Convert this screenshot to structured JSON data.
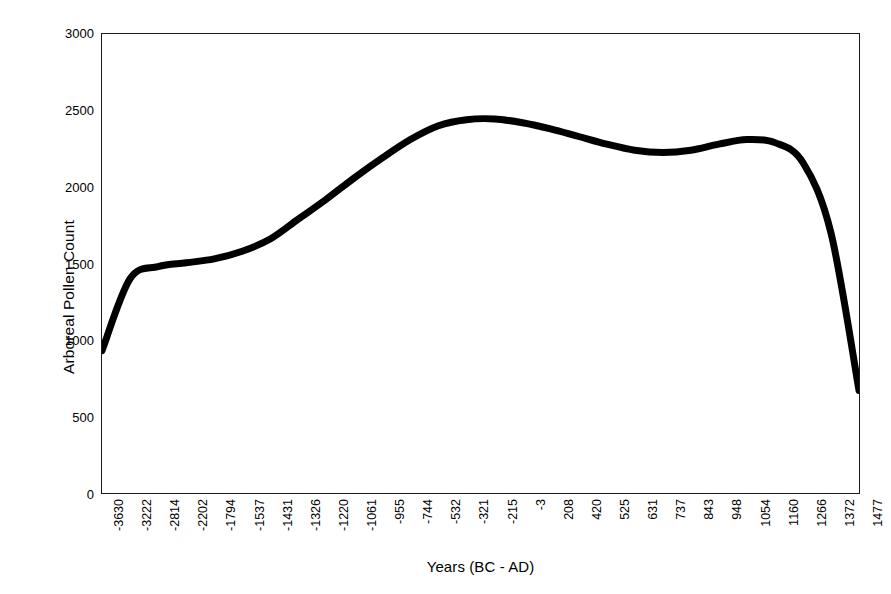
{
  "chart_data": {
    "type": "line",
    "title": "",
    "xlabel": "Years (BC - AD)",
    "ylabel": "Arboreal Pollen Count",
    "ylim": [
      0,
      3000
    ],
    "y_ticks": [
      0,
      500,
      1000,
      1500,
      2000,
      2500,
      3000
    ],
    "y_tick_labels": [
      "0",
      "500",
      "1000",
      "1500",
      "2000",
      "2500",
      "3000"
    ],
    "grid": false,
    "legend": "none",
    "categories": [
      "-3630",
      "-3222",
      "-2814",
      "-2202",
      "-1794",
      "-1537",
      "-1431",
      "-1326",
      "-1220",
      "-1061",
      "-955",
      "-744",
      "-532",
      "-321",
      "-215",
      "-3",
      "208",
      "420",
      "525",
      "631",
      "737",
      "843",
      "948",
      "1054",
      "1160",
      "1266",
      "1372",
      "1477"
    ],
    "series": [
      {
        "name": "Arboreal Pollen Count",
        "color": "#000000",
        "values": [
          930,
          1400,
          1480,
          1505,
          1530,
          1580,
          1660,
          1790,
          1920,
          2060,
          2190,
          2310,
          2400,
          2440,
          2445,
          2420,
          2380,
          2330,
          2280,
          2240,
          2225,
          2240,
          2280,
          2310,
          2290,
          2160,
          1700,
          670
        ]
      }
    ]
  },
  "axes": {
    "x_title": "Years (BC - AD)",
    "y_title": "Arboreal Pollen Count"
  }
}
